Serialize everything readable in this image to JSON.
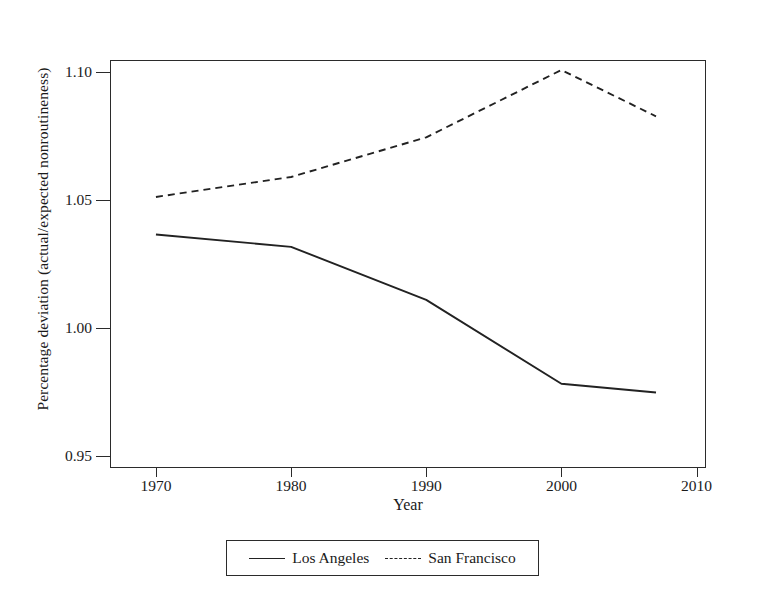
{
  "chart_data": {
    "type": "line",
    "title": "",
    "xlabel": "Year",
    "ylabel": "Percentage deviation (actual/expected nonroutineness)",
    "xlim": [
      1966.6,
      2010.7
    ],
    "ylim": [
      0.9453,
      1.1047
    ],
    "xticks": [
      1970,
      1980,
      1990,
      2000,
      2010
    ],
    "xticklabels": [
      "1970",
      "1980",
      "1990",
      "2000",
      "2010"
    ],
    "yticks": [
      0.95,
      1.0,
      1.05,
      1.1
    ],
    "yticklabels": [
      "0.95",
      "1.00",
      "1.05",
      "1.10"
    ],
    "grid": "horizontal",
    "legend_position": "below-axes",
    "series": [
      {
        "name": "Los Angeles",
        "style": "solid",
        "color": "#222222",
        "x": [
          1970,
          1980,
          1990,
          2000,
          2007
        ],
        "values": [
          1.0365,
          1.0317,
          1.011,
          0.9782,
          0.9748
        ]
      },
      {
        "name": "San Francisco",
        "style": "dashed",
        "color": "#222222",
        "x": [
          1970,
          1980,
          1990,
          2000,
          2007
        ],
        "values": [
          1.0512,
          1.059,
          1.0745,
          1.1008,
          1.0827
        ]
      }
    ]
  },
  "axes": {
    "ylabel": "Percentage deviation (actual/expected nonroutineness)",
    "xlabel": "Year"
  },
  "legend": {
    "items": [
      {
        "label": "Los Angeles",
        "style": "solid"
      },
      {
        "label": "San Francisco",
        "style": "dashed"
      }
    ]
  }
}
